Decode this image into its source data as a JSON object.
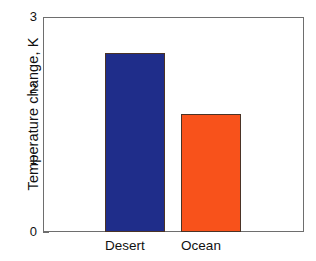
{
  "chart_data": {
    "type": "bar",
    "title": "",
    "xlabel": "",
    "ylabel": "Temperature change, K",
    "categories": [
      "Desert",
      "Ocean"
    ],
    "values": [
      2.5,
      1.65
    ],
    "series": [
      {
        "name": "Temperature change",
        "values": [
          2.5,
          1.65
        ]
      }
    ],
    "bar_colors": [
      "#1f2d8a",
      "#f8521b"
    ],
    "bar_edge_color": "#4a3326",
    "ylim": [
      0,
      3
    ],
    "xlim": [
      0,
      2
    ],
    "yticks": [
      0,
      1,
      2,
      3
    ],
    "ytick_labels": [
      "0",
      "1",
      "2",
      "3"
    ],
    "yminor_ticks": [
      0.5,
      1.5,
      2.5
    ],
    "grid": false,
    "legend": null,
    "legend_position": "none",
    "background_color": "#ffffff",
    "axis_color": "#6e6e6e",
    "text_color": "#111111",
    "annotations": []
  },
  "axis": {
    "y_title": "Temperature change, K",
    "tick_0": "0",
    "tick_1": "1",
    "tick_2": "2",
    "tick_3": "3"
  },
  "xcategories": {
    "cat_0": "Desert",
    "cat_1": "Ocean"
  }
}
